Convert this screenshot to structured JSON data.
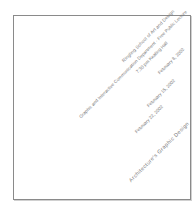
{
  "document": {
    "lines": [
      "Ringling School of Art and Design",
      "Graphic and Interactive Communication Department · Free Public Lecture",
      "7:30 pm Keating Hall",
      "February 8, 2002",
      "February 15, 2002",
      "February 22, 2002",
      "Architecture's Graphic Design"
    ],
    "colors": {
      "text": "#7a7a7a",
      "border": "#8a8a8a",
      "background": "#ffffff"
    }
  }
}
